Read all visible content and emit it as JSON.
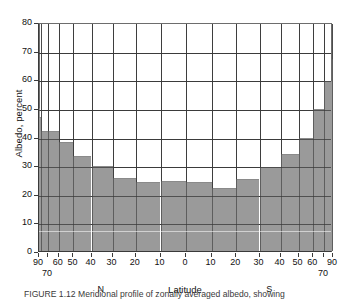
{
  "figure": {
    "caption": "FIGURE 1.12  Meridional profile of zonally averaged albedo, showing",
    "background": "#ffffff",
    "bar_color": "#9a9a9a",
    "axis_color": "#3a3a3a",
    "grid_color": "#4a4a4a"
  },
  "chart_data": {
    "type": "bar",
    "title": "",
    "subtitle": "",
    "xlabel": "Latitude",
    "ylabel": "Albedo, percent",
    "ylim": [
      0,
      80
    ],
    "ytick_labels": [
      "0",
      "10",
      "20",
      "30",
      "40",
      "50",
      "60",
      "70",
      "80"
    ],
    "ytick_values": [
      0,
      10,
      20,
      30,
      40,
      50,
      60,
      70,
      80
    ],
    "grid": true,
    "legend": "none",
    "x_axis_note": "sine-latitude (equal-area) scaling; 90N at left, 0 at centre, 90S at right",
    "hemisphere_labels": [
      "N",
      "S"
    ],
    "xtick_labels_upper": [
      "90",
      "60",
      "50",
      "40",
      "30",
      "20",
      "10",
      "0",
      "10",
      "20",
      "30",
      "40",
      "50",
      "60",
      "90"
    ],
    "xtick_labels_lower": [
      "70",
      "70"
    ],
    "band_edges_deg": [
      90,
      70,
      60,
      50,
      40,
      30,
      20,
      10,
      0,
      -10,
      -20,
      -30,
      -40,
      -50,
      -60,
      -70,
      -90
    ],
    "categories": [
      "90N-70N",
      "70N-60N",
      "60N-50N",
      "50N-40N",
      "40N-30N",
      "30N-20N",
      "20N-10N",
      "10N-0",
      "0-10S",
      "10S-20S",
      "20S-30S",
      "30S-40S",
      "40S-50S",
      "50S-60S",
      "60S-70S",
      "70S-90S"
    ],
    "values": [
      48.5,
      42.0,
      38.0,
      33.3,
      29.8,
      25.6,
      24.1,
      24.6,
      24.0,
      22.0,
      25.0,
      29.5,
      34.0,
      39.5,
      49.5,
      63.0
    ],
    "sub_steps": [
      {
        "x0": 90.0,
        "x1": 86.0,
        "value": 50.0
      },
      {
        "x0": 86.0,
        "x1": 80.0,
        "value": 47.0
      },
      {
        "x0": 80.0,
        "x1": 70.0,
        "value": 42.0
      },
      {
        "x0": 70.0,
        "x1": 60.0,
        "value": 42.0
      },
      {
        "x0": 60.0,
        "x1": 50.0,
        "value": 38.0
      },
      {
        "x0": 50.0,
        "x1": 40.0,
        "value": 33.3
      },
      {
        "x0": 40.0,
        "x1": 30.0,
        "value": 29.8
      },
      {
        "x0": 30.0,
        "x1": 20.0,
        "value": 25.6
      },
      {
        "x0": 20.0,
        "x1": 10.0,
        "value": 24.1
      },
      {
        "x0": 10.0,
        "x1": 0.0,
        "value": 24.6
      },
      {
        "x0": 0.0,
        "x1": -10.0,
        "value": 24.0
      },
      {
        "x0": -10.0,
        "x1": -20.0,
        "value": 22.0
      },
      {
        "x0": -20.0,
        "x1": -30.0,
        "value": 25.0
      },
      {
        "x0": -30.0,
        "x1": -40.0,
        "value": 29.5
      },
      {
        "x0": -40.0,
        "x1": -50.0,
        "value": 34.0
      },
      {
        "x0": -50.0,
        "x1": -60.0,
        "value": 39.5
      },
      {
        "x0": -60.0,
        "x1": -70.0,
        "value": 49.5
      },
      {
        "x0": -70.0,
        "x1": -84.0,
        "value": 59.5
      },
      {
        "x0": -84.0,
        "x1": -90.0,
        "value": 67.0
      }
    ]
  }
}
